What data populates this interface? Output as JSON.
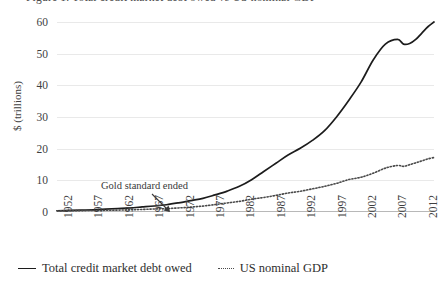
{
  "chart": {
    "clipped_title": "Figure 1. Total credit market debt owed vs US nominal GDP",
    "y_axis_title": "$ (trillions)",
    "annotation": "Gold standard ended"
  },
  "legend": {
    "items": [
      {
        "label": "Total credit market debt owed",
        "style": "solid",
        "color": "#1c1c1c",
        "icon": "solid-line-swatch"
      },
      {
        "label": "US nominal GDP",
        "style": "dotted",
        "color": "#4a4a4a",
        "icon": "dotted-line-swatch"
      }
    ]
  },
  "chart_data": {
    "type": "line",
    "title": "",
    "xlabel": "",
    "ylabel": "$ (trillions)",
    "ylim": [
      0,
      60
    ],
    "xlim": [
      1952,
      2014
    ],
    "grid": true,
    "legend_position": "bottom-left",
    "ytick_labels": [
      "0",
      "10",
      "20",
      "30",
      "40",
      "50",
      "60"
    ],
    "yticks": [
      0,
      10,
      20,
      30,
      40,
      50,
      60
    ],
    "xtick_labels": [
      "1952",
      "1957",
      "1962",
      "1967",
      "1972",
      "1977",
      "1982",
      "1987",
      "1992",
      "1997",
      "2002",
      "2007",
      "2012"
    ],
    "xticks": [
      1952,
      1957,
      1962,
      1967,
      1972,
      1977,
      1982,
      1987,
      1992,
      1997,
      2002,
      2007,
      2012
    ],
    "annotations": [
      {
        "text": "Gold standard ended",
        "x": 1971,
        "y": 1.5,
        "arrow": true
      }
    ],
    "x": [
      1952,
      1954,
      1956,
      1958,
      1960,
      1962,
      1964,
      1966,
      1968,
      1970,
      1972,
      1974,
      1976,
      1978,
      1980,
      1982,
      1984,
      1986,
      1988,
      1990,
      1992,
      1994,
      1996,
      1998,
      2000,
      2002,
      2004,
      2006,
      2008,
      2009,
      2010,
      2011,
      2012,
      2013,
      2014
    ],
    "series": [
      {
        "name": "Total credit market debt owed",
        "style": "solid",
        "color": "#1c1c1c",
        "values": [
          0.4,
          0.5,
          0.6,
          0.7,
          0.9,
          1.1,
          1.3,
          1.6,
          1.9,
          2.3,
          2.9,
          3.6,
          4.3,
          5.4,
          6.6,
          8.1,
          10.2,
          12.8,
          15.4,
          18.0,
          20.1,
          22.6,
          25.7,
          30.1,
          35.3,
          41.0,
          48.0,
          53.0,
          54.5,
          53.0,
          53.2,
          54.5,
          56.5,
          58.5,
          60.0
        ]
      },
      {
        "name": "US nominal GDP",
        "style": "dotted",
        "color": "#4a4a4a",
        "values": [
          0.36,
          0.39,
          0.44,
          0.47,
          0.54,
          0.6,
          0.69,
          0.81,
          0.94,
          1.08,
          1.28,
          1.55,
          1.87,
          2.35,
          2.86,
          3.35,
          4.04,
          4.59,
          5.25,
          5.98,
          6.54,
          7.31,
          8.1,
          9.06,
          10.25,
          10.98,
          12.27,
          13.86,
          14.7,
          14.42,
          14.96,
          15.52,
          16.16,
          16.77,
          17.2
        ]
      }
    ]
  }
}
